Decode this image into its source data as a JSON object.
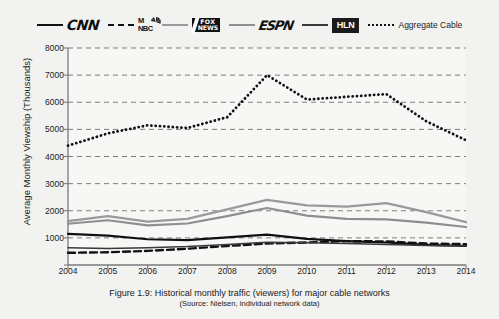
{
  "legend": {
    "items": [
      {
        "name": "CNN",
        "style": "solid-black",
        "kind": "wordmark"
      },
      {
        "name": "MSNBC",
        "style": "dash-black",
        "kind": "wordmark",
        "line1": "M",
        "line2": "NBC"
      },
      {
        "name": "FOX NEWS",
        "style": "solid-gray",
        "kind": "wordmark",
        "line1": "FOX",
        "line2": "NEWS"
      },
      {
        "name": "ESPN",
        "style": "solid-gray2",
        "kind": "wordmark"
      },
      {
        "name": "HLN",
        "style": "solid-dark",
        "kind": "wordmark"
      },
      {
        "name": "Aggregate Cable",
        "style": "dot-black",
        "kind": "text"
      }
    ]
  },
  "caption": {
    "line1": "Figure 1.9: Historical monthly traffic (viewers) for major cable networks",
    "line2": "(Source: Nielsen, individual network data)"
  },
  "chart_data": {
    "type": "line",
    "title": "",
    "xlabel": "",
    "ylabel": "Average Monthly Viewship (Thousands)",
    "x": [
      2004,
      2005,
      2006,
      2007,
      2008,
      2009,
      2010,
      2011,
      2012,
      2013,
      2014
    ],
    "xticklabels": [
      "2004",
      "2005",
      "2006",
      "2007",
      "2008",
      "2009",
      "2010",
      "2011",
      "2012",
      "2013",
      "2014"
    ],
    "xlim": [
      2004,
      2014
    ],
    "ylim": [
      0,
      8000
    ],
    "yticks": [
      0,
      1000,
      2000,
      3000,
      4000,
      5000,
      6000,
      7000,
      8000
    ],
    "yticklabels": [
      "",
      "1000",
      "2000",
      "3000",
      "4000",
      "5000",
      "6000",
      "7000",
      "8000"
    ],
    "grid": "horizontal-dashed",
    "legend_position": "top",
    "series": [
      {
        "name": "CNN",
        "style": "solid",
        "color": "#111111",
        "width": 2.2,
        "values": [
          1150,
          1080,
          950,
          920,
          1020,
          1120,
          960,
          880,
          830,
          740,
          700
        ]
      },
      {
        "name": "MSNBC",
        "style": "dashed",
        "color": "#111111",
        "width": 2.4,
        "values": [
          450,
          470,
          520,
          600,
          700,
          790,
          830,
          880,
          870,
          790,
          770
        ]
      },
      {
        "name": "FOX NEWS",
        "style": "solid",
        "color": "#9a9a9a",
        "width": 2.2,
        "values": [
          1620,
          1800,
          1600,
          1700,
          2050,
          2400,
          2200,
          2150,
          2280,
          1950,
          1580
        ]
      },
      {
        "name": "ESPN",
        "style": "solid",
        "color": "#8e8e8e",
        "width": 2.2,
        "values": [
          1520,
          1650,
          1460,
          1530,
          1800,
          2100,
          1820,
          1700,
          1680,
          1560,
          1400
        ]
      },
      {
        "name": "HLN",
        "style": "solid",
        "color": "#3a3a3a",
        "width": 1.5,
        "values": [
          640,
          610,
          640,
          680,
          760,
          840,
          820,
          790,
          760,
          720,
          700
        ]
      },
      {
        "name": "Aggregate Cable",
        "style": "dotted",
        "color": "#111111",
        "width": 2.8,
        "values": [
          4400,
          4850,
          5150,
          5050,
          5450,
          7000,
          6100,
          6200,
          6300,
          5300,
          4600
        ]
      }
    ]
  }
}
